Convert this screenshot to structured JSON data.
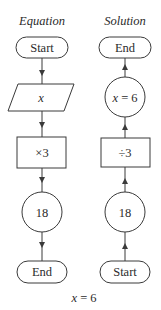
{
  "diagram": {
    "columns": [
      {
        "title": "Equation",
        "direction": "down",
        "nodes": [
          {
            "shape": "terminator",
            "label": "Start"
          },
          {
            "shape": "parallelogram",
            "label": "x"
          },
          {
            "shape": "rectangle",
            "label": "×3"
          },
          {
            "shape": "circle",
            "label": "18"
          },
          {
            "shape": "terminator",
            "label": "End"
          }
        ]
      },
      {
        "title": "Solution",
        "direction": "up",
        "nodes": [
          {
            "shape": "terminator",
            "label": "End"
          },
          {
            "shape": "circle",
            "label": "x = 6"
          },
          {
            "shape": "rectangle",
            "label": "÷3"
          },
          {
            "shape": "circle",
            "label": "18"
          },
          {
            "shape": "terminator",
            "label": "Start"
          }
        ]
      }
    ],
    "caption": "x = 6"
  }
}
